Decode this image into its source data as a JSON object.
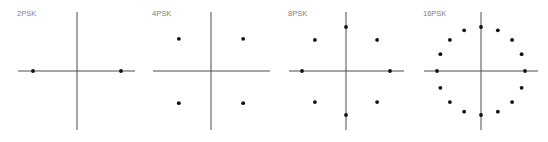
{
  "diagram": {
    "panels": [
      {
        "label": "2PSK",
        "order": 2,
        "phase_offset_deg": 0
      },
      {
        "label": "4PSK",
        "order": 4,
        "phase_offset_deg": 45
      },
      {
        "label": "8PSK",
        "order": 8,
        "phase_offset_deg": 0
      },
      {
        "label": "16PSK",
        "order": 16,
        "phase_offset_deg": 0
      }
    ],
    "colors": {
      "axis": "#3a3a3a",
      "point": "#111111",
      "label": "#808080",
      "background": "#ffffff"
    }
  }
}
